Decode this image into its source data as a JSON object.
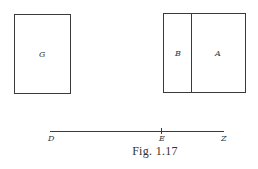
{
  "figure": {
    "caption": "Fig. 1.17",
    "rect_g": {
      "label": "G"
    },
    "rect_ba": {
      "left_label": "B",
      "right_label": "A"
    },
    "line": {
      "start_label": "D",
      "mid_label": "E",
      "end_label": "Z"
    }
  },
  "colors": {
    "stroke": "#3a3a3a",
    "text": "#333333",
    "background": "#ffffff"
  }
}
